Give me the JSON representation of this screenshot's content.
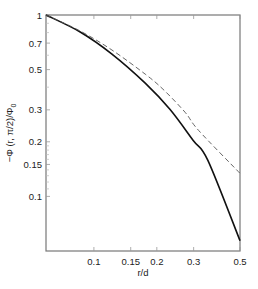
{
  "chart_data": {
    "type": "line",
    "title": "",
    "xlabel": "r/d",
    "ylabel": "−Φ (r, π/2)/Φ",
    "ylabel_subscript": "0",
    "xscale": "log",
    "yscale": "log",
    "xlim": [
      0.059,
      0.5
    ],
    "ylim": [
      0.05,
      1
    ],
    "grid": false,
    "legend": "none",
    "x_ticks": [
      {
        "value": 0.1,
        "label": "0.1"
      },
      {
        "value": 0.15,
        "label": "0.15"
      },
      {
        "value": 0.2,
        "label": "0.2"
      },
      {
        "value": 0.3,
        "label": "0.3"
      },
      {
        "value": 0.5,
        "label": "0.5"
      }
    ],
    "y_ticks": [
      {
        "value": 1,
        "label": "1"
      },
      {
        "value": 0.7,
        "label": "0.7"
      },
      {
        "value": 0.5,
        "label": "0.5"
      },
      {
        "value": 0.3,
        "label": "0.3"
      },
      {
        "value": 0.2,
        "label": "0.2"
      },
      {
        "value": 0.15,
        "label": "0.15"
      },
      {
        "value": 0.1,
        "label": "0.1"
      }
    ],
    "y_minor_ticks": [
      0.9,
      0.8,
      0.6,
      0.4,
      0.19,
      0.18,
      0.17,
      0.16,
      0.14,
      0.13,
      0.12,
      0.11
    ],
    "series": [
      {
        "name": "solid",
        "style": "solid",
        "color": "#111111",
        "x": [
          0.059,
          0.086,
          0.122,
          0.176,
          0.231,
          0.298,
          0.351,
          0.5
        ],
        "y": [
          1.0,
          0.806,
          0.609,
          0.421,
          0.302,
          0.204,
          0.158,
          0.057
        ]
      },
      {
        "name": "dashed",
        "style": "dashed",
        "color": "#555555",
        "x": [
          0.059,
          0.086,
          0.122,
          0.176,
          0.214,
          0.273,
          0.317,
          0.5
        ],
        "y": [
          1.0,
          0.816,
          0.641,
          0.472,
          0.39,
          0.291,
          0.231,
          0.134
        ]
      }
    ]
  }
}
